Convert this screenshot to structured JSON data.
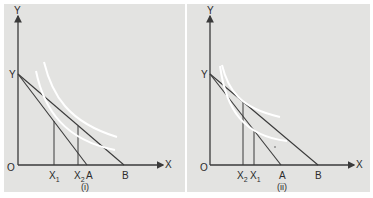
{
  "figure": {
    "panels": [
      {
        "id": "i",
        "caption": "(i)",
        "axis_labels": {
          "y": "Y",
          "x": "X",
          "origin": "O",
          "y_intercept": "Y"
        },
        "x_points": [
          {
            "label": "X",
            "sub": "1"
          },
          {
            "label": "X",
            "sub": "2"
          },
          {
            "label": "A"
          },
          {
            "label": "B"
          }
        ]
      },
      {
        "id": "ii",
        "caption": "(ii)",
        "axis_labels": {
          "y": "Y",
          "x": "X",
          "origin": "O",
          "y_intercept": "Y"
        },
        "x_points": [
          {
            "label": "X",
            "sub": "2"
          },
          {
            "label": "X",
            "sub": "1"
          },
          {
            "label": "A"
          },
          {
            "label": "B"
          }
        ]
      }
    ],
    "colors": {
      "background": "#e3e3e1",
      "lines": "#3a3a3a",
      "indifference_curves": "#ffffff"
    }
  }
}
